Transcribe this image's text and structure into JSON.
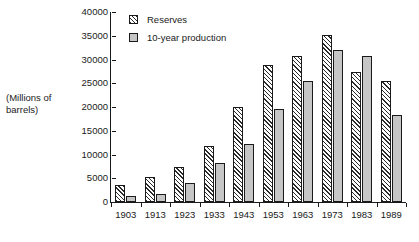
{
  "chart_data": {
    "type": "bar",
    "title": "",
    "subtitle": "",
    "xlabel": "",
    "ylabel": "(Millions of barrels)",
    "ylabel_lines": [
      "(Millions of",
      "barrels)"
    ],
    "categories": [
      "1903",
      "1913",
      "1923",
      "1933",
      "1943",
      "1953",
      "1963",
      "1973",
      "1983",
      "1989"
    ],
    "series": [
      {
        "name": "Reserves",
        "fill": "diagonal-hatch",
        "values": [
          3500,
          5300,
          7400,
          11800,
          19900,
          28800,
          30700,
          35100,
          27400,
          25500
        ]
      },
      {
        "name": "10-year production",
        "fill": "solid-gray",
        "values": [
          1200,
          1700,
          4100,
          8200,
          12200,
          19500,
          25500,
          32100,
          30800,
          18400
        ]
      }
    ],
    "ylim": [
      0,
      40000
    ],
    "ytick_values": [
      40000,
      35000,
      30000,
      25000,
      20000,
      15000,
      10000,
      5000,
      0
    ],
    "ytick_labels": [
      "40000",
      "35000",
      "30000",
      "25000",
      "20000",
      "15000",
      "10000",
      "5000",
      "0"
    ],
    "grid": false,
    "legend_position": "top-left-inside",
    "legend_entries": [
      "Reserves",
      "10-year production"
    ],
    "colors": {
      "axis": "#1a1a1a",
      "text": "#1a1a1a",
      "reserves_hatch": "#2b2b2b",
      "reserves_background": "#ffffff",
      "production_fill": "#c6c6c6",
      "bar_outline": "#1a1a1a",
      "page_background": "#ffffff"
    }
  }
}
